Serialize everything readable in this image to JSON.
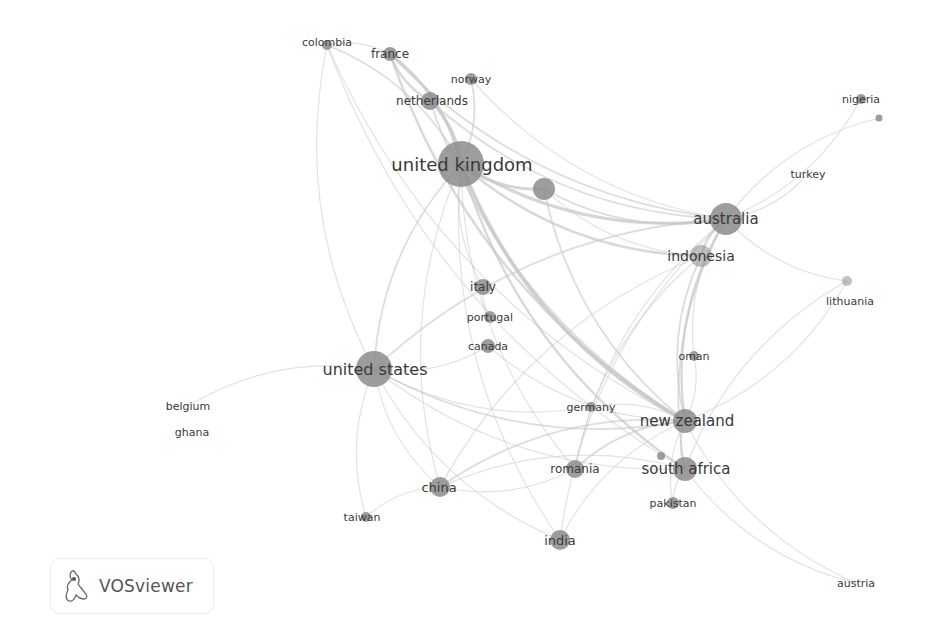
{
  "app": {
    "name": "VOSviewer",
    "logo_icon": "vosviewer-logo-icon"
  },
  "network": {
    "type": "co-authorship-countries",
    "node_color": "#8c8c8c",
    "edge_color": "#c8c8c8",
    "nodes": [
      {
        "id": "colombia",
        "label": "colombia",
        "weight": 2
      },
      {
        "id": "france",
        "label": "france",
        "weight": 3
      },
      {
        "id": "norway",
        "label": "norway",
        "weight": 2
      },
      {
        "id": "netherlands",
        "label": "netherlands",
        "weight": 3
      },
      {
        "id": "united-kingdom",
        "label": "united kingdom",
        "weight": 10
      },
      {
        "id": "unlabeled-1",
        "label": "",
        "weight": 4
      },
      {
        "id": "nigeria",
        "label": "nigeria",
        "weight": 2
      },
      {
        "id": "nigeria-2",
        "label": "",
        "weight": 1
      },
      {
        "id": "turkey",
        "label": "turkey",
        "weight": 1
      },
      {
        "id": "australia",
        "label": "australia",
        "weight": 6
      },
      {
        "id": "indonesia",
        "label": "indonesia",
        "weight": 4
      },
      {
        "id": "lithuania",
        "label": "lithuania",
        "weight": 1
      },
      {
        "id": "italy",
        "label": "italy",
        "weight": 2
      },
      {
        "id": "portugal",
        "label": "portugal",
        "weight": 2
      },
      {
        "id": "canada",
        "label": "canada",
        "weight": 2
      },
      {
        "id": "united-states",
        "label": "united states",
        "weight": 7
      },
      {
        "id": "oman",
        "label": "oman",
        "weight": 2
      },
      {
        "id": "belgium",
        "label": "belgium",
        "weight": 1
      },
      {
        "id": "ghana",
        "label": "ghana",
        "weight": 1
      },
      {
        "id": "germany",
        "label": "germany",
        "weight": 2
      },
      {
        "id": "new-zealand",
        "label": "new zealand",
        "weight": 5
      },
      {
        "id": "romania",
        "label": "romania",
        "weight": 3
      },
      {
        "id": "south-africa",
        "label": "south africa",
        "weight": 4
      },
      {
        "id": "unlabeled-2",
        "label": "",
        "weight": 1
      },
      {
        "id": "china",
        "label": "china",
        "weight": 3
      },
      {
        "id": "pakistan",
        "label": "pakistan",
        "weight": 2
      },
      {
        "id": "taiwan",
        "label": "taiwan",
        "weight": 2
      },
      {
        "id": "india",
        "label": "india",
        "weight": 3
      },
      {
        "id": "austria",
        "label": "austria",
        "weight": 1
      }
    ],
    "edges": [
      [
        "united-kingdom",
        "france",
        4
      ],
      [
        "united-kingdom",
        "netherlands",
        4
      ],
      [
        "united-kingdom",
        "norway",
        2
      ],
      [
        "united-kingdom",
        "colombia",
        2
      ],
      [
        "united-kingdom",
        "unlabeled-1",
        4
      ],
      [
        "united-kingdom",
        "australia",
        4
      ],
      [
        "united-kingdom",
        "new-zealand",
        5
      ],
      [
        "united-kingdom",
        "united-states",
        2
      ],
      [
        "united-kingdom",
        "indonesia",
        3
      ],
      [
        "united-kingdom",
        "south-africa",
        3
      ],
      [
        "united-kingdom",
        "italy",
        1
      ],
      [
        "united-kingdom",
        "china",
        1
      ],
      [
        "united-kingdom",
        "india",
        1
      ],
      [
        "united-kingdom",
        "romania",
        1
      ],
      [
        "france",
        "netherlands",
        3
      ],
      [
        "france",
        "new-zealand",
        3
      ],
      [
        "france",
        "australia",
        2
      ],
      [
        "france",
        "colombia",
        1
      ],
      [
        "netherlands",
        "new-zealand",
        2
      ],
      [
        "netherlands",
        "australia",
        2
      ],
      [
        "norway",
        "australia",
        1
      ],
      [
        "colombia",
        "united-states",
        1
      ],
      [
        "colombia",
        "new-zealand",
        1
      ],
      [
        "colombia",
        "south-africa",
        1
      ],
      [
        "unlabeled-1",
        "australia",
        2
      ],
      [
        "unlabeled-1",
        "new-zealand",
        2
      ],
      [
        "unlabeled-1",
        "indonesia",
        1
      ],
      [
        "australia",
        "indonesia",
        3
      ],
      [
        "australia",
        "new-zealand",
        3
      ],
      [
        "australia",
        "nigeria",
        1
      ],
      [
        "australia",
        "turkey",
        1
      ],
      [
        "australia",
        "lithuania",
        1
      ],
      [
        "australia",
        "united-states",
        2
      ],
      [
        "australia",
        "south-africa",
        2
      ],
      [
        "australia",
        "oman",
        1
      ],
      [
        "australia",
        "romania",
        1
      ],
      [
        "australia",
        "india",
        1
      ],
      [
        "indonesia",
        "new-zealand",
        2
      ],
      [
        "indonesia",
        "romania",
        1
      ],
      [
        "indonesia",
        "china",
        1
      ],
      [
        "united-states",
        "new-zealand",
        2
      ],
      [
        "united-states",
        "china",
        1
      ],
      [
        "united-states",
        "taiwan",
        1
      ],
      [
        "united-states",
        "india",
        1
      ],
      [
        "united-states",
        "belgium",
        1
      ],
      [
        "united-states",
        "canada",
        1
      ],
      [
        "united-states",
        "south-africa",
        1
      ],
      [
        "united-states",
        "germany",
        1
      ],
      [
        "new-zealand",
        "south-africa",
        2
      ],
      [
        "new-zealand",
        "romania",
        2
      ],
      [
        "new-zealand",
        "china",
        2
      ],
      [
        "new-zealand",
        "pakistan",
        1
      ],
      [
        "new-zealand",
        "austria",
        1
      ],
      [
        "new-zealand",
        "germany",
        1
      ],
      [
        "new-zealand",
        "india",
        1
      ],
      [
        "new-zealand",
        "oman",
        1
      ],
      [
        "new-zealand",
        "lithuania",
        1
      ],
      [
        "south-africa",
        "pakistan",
        1
      ],
      [
        "south-africa",
        "china",
        1
      ],
      [
        "south-africa",
        "austria",
        1
      ],
      [
        "china",
        "taiwan",
        1
      ],
      [
        "china",
        "romania",
        1
      ],
      [
        "italy",
        "portugal",
        1
      ],
      [
        "canada",
        "new-zealand",
        1
      ],
      [
        "lithuania",
        "south-africa",
        1
      ],
      [
        "nigeria-2",
        "australia",
        1
      ]
    ]
  }
}
